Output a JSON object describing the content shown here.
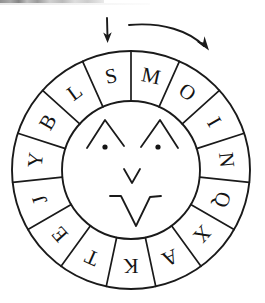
{
  "figure": {
    "ink_color": "#1a1a1a",
    "background_color": "#ffffff"
  },
  "wheel": {
    "center_x": 131,
    "center_y": 170,
    "outer_radius": 119,
    "inner_radius": 69,
    "segment_count": 15,
    "segment_degrees": 24,
    "start_angle_degrees": -12,
    "letters": [
      {
        "index": 0,
        "label": "S",
        "angle_degrees": -12
      },
      {
        "index": 1,
        "label": "M",
        "angle_degrees": 12
      },
      {
        "index": 2,
        "label": "O",
        "angle_degrees": 36
      },
      {
        "index": 3,
        "label": "I",
        "angle_degrees": 60
      },
      {
        "index": 4,
        "label": "N",
        "angle_degrees": 84
      },
      {
        "index": 5,
        "label": "Q",
        "angle_degrees": 108
      },
      {
        "index": 6,
        "label": "X",
        "angle_degrees": 132
      },
      {
        "index": 7,
        "label": "A",
        "angle_degrees": 156
      },
      {
        "index": 8,
        "label": "K",
        "angle_degrees": 180
      },
      {
        "index": 9,
        "label": "T",
        "angle_degrees": 204
      },
      {
        "index": 10,
        "label": "E",
        "angle_degrees": 228
      },
      {
        "index": 11,
        "label": "J",
        "angle_degrees": 252
      },
      {
        "index": 12,
        "label": "Y",
        "angle_degrees": 276
      },
      {
        "index": 13,
        "label": "B",
        "angle_degrees": 300
      },
      {
        "index": 14,
        "label": "L",
        "angle_degrees": 324
      }
    ],
    "sequence_clockwise_from_top": "S M O I N Q X A K T E J Y B L"
  },
  "face": {
    "left_brow": "chevron",
    "right_brow": "chevron",
    "left_eye": "dot",
    "right_eye": "dot",
    "nose": "small-v",
    "mouth": "large-v-with-whiskers"
  },
  "annotations": {
    "pointer": {
      "name": "index-pointer-arrow",
      "direction": "down",
      "points_to_segment": "S"
    },
    "rotation": {
      "name": "rotation-arrow",
      "direction": "clockwise"
    }
  }
}
